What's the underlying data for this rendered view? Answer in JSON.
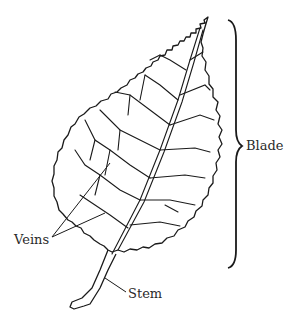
{
  "diagram": {
    "labels": {
      "blade": "Blade",
      "veins": "Veins",
      "stem": "Stem"
    },
    "colors": {
      "line": "#1a1a1a",
      "text": "#2a2a2a",
      "background": "#ffffff"
    }
  }
}
